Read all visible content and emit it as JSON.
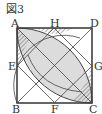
{
  "figure_title": "図3",
  "labels": {
    "A": "A",
    "B": "B",
    "C": "C",
    "D": "D",
    "E": "E",
    "F": "F",
    "G": "G",
    "H": "H"
  },
  "colors": {
    "lens": "#dcdcdc",
    "stroke": "#444444",
    "hatch": "#666666"
  }
}
